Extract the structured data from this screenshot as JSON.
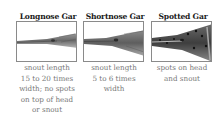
{
  "figure": {
    "panels": [
      {
        "title": "Longnose Gar",
        "image": "longnose-gar-head",
        "caption_lines": [
          "snout length",
          "15 to 20 times",
          "width; no spots",
          "on top of head",
          "or snout"
        ]
      },
      {
        "title": "Shortnose Gar",
        "image": "shortnose-gar-head",
        "caption_lines": [
          "snout length",
          "5 to 6 times",
          "width"
        ]
      },
      {
        "title": "Spotted Gar",
        "image": "spotted-gar-head",
        "caption_lines": [
          "spots on head",
          "and snout"
        ]
      }
    ]
  }
}
